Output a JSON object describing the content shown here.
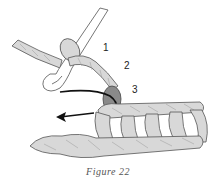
{
  "figure": {
    "caption": "Figure 22",
    "labels": [
      "1",
      "2",
      "3"
    ],
    "colors": {
      "yarn": "#d8d8d8",
      "yarn_highlight_loop": "#8a8a8a",
      "outline": "#555555",
      "arrow": "#111111",
      "caption": "#555555"
    }
  }
}
